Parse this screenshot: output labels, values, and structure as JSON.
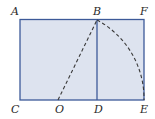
{
  "diagram": {
    "labels": {
      "A": "A",
      "B": "B",
      "F": "F",
      "C": "C",
      "O": "O",
      "D": "D",
      "E": "E"
    },
    "colors": {
      "fill": "#dde3ef",
      "stroke": "#3d5a99",
      "dashed": "#3a3a3a"
    }
  }
}
